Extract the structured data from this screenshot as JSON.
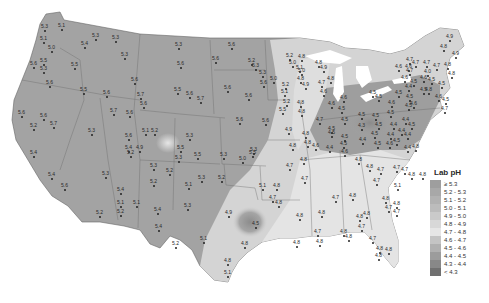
{
  "legend": {
    "title": "Lab pH",
    "items": [
      {
        "label": "≥ 5.3",
        "color": "#9e9e9e"
      },
      {
        "label": "5.2 - 5.3",
        "color": "#a8a8a8"
      },
      {
        "label": "5.1 - 5.2",
        "color": "#b2b2b2"
      },
      {
        "label": "5.0 - 5.1",
        "color": "#bcbcbc"
      },
      {
        "label": "4.9 - 5.0",
        "color": "#cacaca"
      },
      {
        "label": "4.8 - 4.9",
        "color": "#d8d8d8"
      },
      {
        "label": "4.7 - 4.8",
        "color": "#e6e6e6"
      },
      {
        "label": "4.6 - 4.7",
        "color": "#c4c4c4"
      },
      {
        "label": "4.5 - 4.6",
        "color": "#b0b0b0"
      },
      {
        "label": "4.4 - 4.5",
        "color": "#9c9c9c"
      },
      {
        "label": "4.3 - 4.4",
        "color": "#888888"
      },
      {
        "label": "< 4.3",
        "color": "#707070"
      }
    ]
  },
  "stations": [
    {
      "x": 58,
      "y": 23,
      "v": "5.1"
    },
    {
      "x": 41,
      "y": 24,
      "v": "5.3"
    },
    {
      "x": 40,
      "y": 36,
      "v": "5.1"
    },
    {
      "x": 48,
      "y": 45,
      "v": "5.0"
    },
    {
      "x": 30,
      "y": 61,
      "v": "5.6"
    },
    {
      "x": 40,
      "y": 58,
      "v": "5.5"
    },
    {
      "x": 40,
      "y": 66,
      "v": "5.3"
    },
    {
      "x": 46,
      "y": 80,
      "v": "5.6"
    },
    {
      "x": 71,
      "y": 62,
      "v": "5.5"
    },
    {
      "x": 81,
      "y": 41,
      "v": "5.4"
    },
    {
      "x": 92,
      "y": 33,
      "v": "5.3"
    },
    {
      "x": 112,
      "y": 35,
      "v": "5.3"
    },
    {
      "x": 121,
      "y": 52,
      "v": "5.3"
    },
    {
      "x": 80,
      "y": 87,
      "v": "5.5"
    },
    {
      "x": 103,
      "y": 90,
      "v": "5.6"
    },
    {
      "x": 131,
      "y": 77,
      "v": "5.6"
    },
    {
      "x": 137,
      "y": 92,
      "v": "5.7"
    },
    {
      "x": 140,
      "y": 101,
      "v": "5.6"
    },
    {
      "x": 110,
      "y": 108,
      "v": "5.7"
    },
    {
      "x": 126,
      "y": 110,
      "v": "5.6"
    },
    {
      "x": 18,
      "y": 110,
      "v": "5.6"
    },
    {
      "x": 40,
      "y": 113,
      "v": "5.6"
    },
    {
      "x": 30,
      "y": 123,
      "v": "5.2"
    },
    {
      "x": 50,
      "y": 121,
      "v": "5.7"
    },
    {
      "x": 88,
      "y": 128,
      "v": "5.3"
    },
    {
      "x": 125,
      "y": 133,
      "v": "5.6"
    },
    {
      "x": 125,
      "y": 145,
      "v": "5.4"
    },
    {
      "x": 142,
      "y": 128,
      "v": "5.1"
    },
    {
      "x": 151,
      "y": 128,
      "v": "5.2"
    },
    {
      "x": 127,
      "y": 150,
      "v": "5.2"
    },
    {
      "x": 136,
      "y": 145,
      "v": "4.9"
    },
    {
      "x": 30,
      "y": 150,
      "v": "5.4"
    },
    {
      "x": 48,
      "y": 172,
      "v": "5.4"
    },
    {
      "x": 61,
      "y": 183,
      "v": "5.6"
    },
    {
      "x": 102,
      "y": 171,
      "v": "5.3"
    },
    {
      "x": 117,
      "y": 187,
      "v": "5.4"
    },
    {
      "x": 117,
      "y": 200,
      "v": "5.1"
    },
    {
      "x": 133,
      "y": 200,
      "v": "5.1"
    },
    {
      "x": 117,
      "y": 209,
      "v": "5.2"
    },
    {
      "x": 96,
      "y": 210,
      "v": "5.2"
    },
    {
      "x": 150,
      "y": 179,
      "v": "5.2"
    },
    {
      "x": 154,
      "y": 207,
      "v": "5.4"
    },
    {
      "x": 155,
      "y": 224,
      "v": "5.4"
    },
    {
      "x": 172,
      "y": 241,
      "v": "5.2"
    },
    {
      "x": 175,
      "y": 155,
      "v": "5.3"
    },
    {
      "x": 166,
      "y": 168,
      "v": "5.2"
    },
    {
      "x": 150,
      "y": 163,
      "v": "5.3"
    },
    {
      "x": 177,
      "y": 145,
      "v": "5.5"
    },
    {
      "x": 194,
      "y": 152,
      "v": "5.5"
    },
    {
      "x": 185,
      "y": 182,
      "v": "5.1"
    },
    {
      "x": 184,
      "y": 203,
      "v": "5.3"
    },
    {
      "x": 198,
      "y": 175,
      "v": "5.3"
    },
    {
      "x": 200,
      "y": 236,
      "v": "5.1"
    },
    {
      "x": 218,
      "y": 175,
      "v": "5.2"
    },
    {
      "x": 225,
      "y": 210,
      "v": "4.9"
    },
    {
      "x": 250,
      "y": 147,
      "v": "5.3"
    },
    {
      "x": 249,
      "y": 150,
      "v": "5.5"
    },
    {
      "x": 239,
      "y": 156,
      "v": "5.0"
    },
    {
      "x": 252,
      "y": 221,
      "v": "4.5"
    },
    {
      "x": 241,
      "y": 241,
      "v": "4.8"
    },
    {
      "x": 224,
      "y": 258,
      "v": "4.8"
    },
    {
      "x": 224,
      "y": 270,
      "v": "5.1"
    },
    {
      "x": 259,
      "y": 183,
      "v": "5.1"
    },
    {
      "x": 273,
      "y": 183,
      "v": "4.8"
    },
    {
      "x": 269,
      "y": 195,
      "v": "4.7"
    },
    {
      "x": 275,
      "y": 200,
      "v": "4.8"
    },
    {
      "x": 296,
      "y": 213,
      "v": "4.8"
    },
    {
      "x": 293,
      "y": 240,
      "v": "4.8"
    },
    {
      "x": 286,
      "y": 163,
      "v": "4.7"
    },
    {
      "x": 301,
      "y": 176,
      "v": "4.7"
    },
    {
      "x": 300,
      "y": 157,
      "v": "4.8"
    },
    {
      "x": 175,
      "y": 42,
      "v": "5.3"
    },
    {
      "x": 177,
      "y": 61,
      "v": "5.6"
    },
    {
      "x": 212,
      "y": 56,
      "v": "5.6"
    },
    {
      "x": 228,
      "y": 42,
      "v": "5.6"
    },
    {
      "x": 174,
      "y": 87,
      "v": "5.5"
    },
    {
      "x": 186,
      "y": 91,
      "v": "5.6"
    },
    {
      "x": 197,
      "y": 96,
      "v": "5.7"
    },
    {
      "x": 224,
      "y": 85,
      "v": "5.6"
    },
    {
      "x": 245,
      "y": 93,
      "v": "5.6"
    },
    {
      "x": 236,
      "y": 117,
      "v": "5.6"
    },
    {
      "x": 186,
      "y": 133,
      "v": "5.3"
    },
    {
      "x": 220,
      "y": 152,
      "v": "5.3"
    },
    {
      "x": 248,
      "y": 58,
      "v": "5.2"
    },
    {
      "x": 252,
      "y": 63,
      "v": "5.3"
    },
    {
      "x": 259,
      "y": 70,
      "v": "5.3"
    },
    {
      "x": 260,
      "y": 80,
      "v": "5.6"
    },
    {
      "x": 270,
      "y": 76,
      "v": "5.0"
    },
    {
      "x": 282,
      "y": 82,
      "v": "5.2"
    },
    {
      "x": 281,
      "y": 89,
      "v": "5.1"
    },
    {
      "x": 283,
      "y": 99,
      "v": "5.2"
    },
    {
      "x": 279,
      "y": 107,
      "v": "5.5"
    },
    {
      "x": 262,
      "y": 118,
      "v": "5.6"
    },
    {
      "x": 285,
      "y": 127,
      "v": "4.9"
    },
    {
      "x": 289,
      "y": 143,
      "v": "4.8"
    },
    {
      "x": 286,
      "y": 53,
      "v": "5.2"
    },
    {
      "x": 289,
      "y": 60,
      "v": "5.0"
    },
    {
      "x": 298,
      "y": 54,
      "v": "4.8"
    },
    {
      "x": 296,
      "y": 65,
      "v": "5.1"
    },
    {
      "x": 298,
      "y": 68,
      "v": "5.0"
    },
    {
      "x": 297,
      "y": 76,
      "v": "4.8"
    },
    {
      "x": 302,
      "y": 82,
      "v": "4.9"
    },
    {
      "x": 297,
      "y": 100,
      "v": "4.8"
    },
    {
      "x": 298,
      "y": 109,
      "v": "4.8"
    },
    {
      "x": 302,
      "y": 131,
      "v": "4.8"
    },
    {
      "x": 304,
      "y": 140,
      "v": "4.8"
    },
    {
      "x": 315,
      "y": 60,
      "v": "4.8"
    },
    {
      "x": 320,
      "y": 65,
      "v": "4.9"
    },
    {
      "x": 318,
      "y": 80,
      "v": "4.7"
    },
    {
      "x": 320,
      "y": 89,
      "v": "4.6"
    },
    {
      "x": 327,
      "y": 76,
      "v": "4.8"
    },
    {
      "x": 328,
      "y": 101,
      "v": "4.6"
    },
    {
      "x": 338,
      "y": 106,
      "v": "4.5"
    },
    {
      "x": 340,
      "y": 95,
      "v": "4.6"
    },
    {
      "x": 316,
      "y": 117,
      "v": "4.7"
    },
    {
      "x": 328,
      "y": 126,
      "v": "4.5"
    },
    {
      "x": 328,
      "y": 130,
      "v": "4.5"
    },
    {
      "x": 341,
      "y": 117,
      "v": "4.5"
    },
    {
      "x": 341,
      "y": 134,
      "v": "4.5"
    },
    {
      "x": 312,
      "y": 143,
      "v": "4.6"
    },
    {
      "x": 326,
      "y": 145,
      "v": "4.4"
    },
    {
      "x": 340,
      "y": 141,
      "v": "4.5"
    },
    {
      "x": 341,
      "y": 149,
      "v": "4.6"
    },
    {
      "x": 358,
      "y": 112,
      "v": "4.5"
    },
    {
      "x": 358,
      "y": 123,
      "v": "4.3"
    },
    {
      "x": 372,
      "y": 113,
      "v": "4.5"
    },
    {
      "x": 375,
      "y": 122,
      "v": "4.5"
    },
    {
      "x": 359,
      "y": 137,
      "v": "4.4"
    },
    {
      "x": 371,
      "y": 131,
      "v": "4.5"
    },
    {
      "x": 374,
      "y": 141,
      "v": "4.5"
    },
    {
      "x": 387,
      "y": 110,
      "v": "4.5"
    },
    {
      "x": 390,
      "y": 122,
      "v": "4.4"
    },
    {
      "x": 387,
      "y": 132,
      "v": "4.4"
    },
    {
      "x": 386,
      "y": 141,
      "v": "4.6"
    },
    {
      "x": 393,
      "y": 138,
      "v": "4.5"
    },
    {
      "x": 402,
      "y": 117,
      "v": "4.4"
    },
    {
      "x": 408,
      "y": 122,
      "v": "4.5"
    },
    {
      "x": 398,
      "y": 128,
      "v": "4.4"
    },
    {
      "x": 404,
      "y": 132,
      "v": "4.4"
    },
    {
      "x": 412,
      "y": 144,
      "v": "4.8"
    },
    {
      "x": 404,
      "y": 145,
      "v": "4.4"
    },
    {
      "x": 375,
      "y": 94,
      "v": "4.5"
    },
    {
      "x": 369,
      "y": 90,
      "v": "4.5"
    },
    {
      "x": 388,
      "y": 100,
      "v": "4.6"
    },
    {
      "x": 395,
      "y": 90,
      "v": "4.5"
    },
    {
      "x": 406,
      "y": 94,
      "v": "4.5"
    },
    {
      "x": 405,
      "y": 103,
      "v": "4.5"
    },
    {
      "x": 410,
      "y": 101,
      "v": "4.6"
    },
    {
      "x": 405,
      "y": 84,
      "v": "4.4"
    },
    {
      "x": 401,
      "y": 75,
      "v": "4.6"
    },
    {
      "x": 395,
      "y": 64,
      "v": "4.6"
    },
    {
      "x": 406,
      "y": 68,
      "v": "4.7"
    },
    {
      "x": 410,
      "y": 79,
      "v": "4.5"
    },
    {
      "x": 420,
      "y": 75,
      "v": "4.6"
    },
    {
      "x": 412,
      "y": 60,
      "v": "4.7"
    },
    {
      "x": 406,
      "y": 57,
      "v": "4.7"
    },
    {
      "x": 405,
      "y": 64,
      "v": "4.6"
    },
    {
      "x": 424,
      "y": 69,
      "v": "4.0"
    },
    {
      "x": 428,
      "y": 77,
      "v": "4.5"
    },
    {
      "x": 438,
      "y": 81,
      "v": "4.5"
    },
    {
      "x": 420,
      "y": 87,
      "v": "4.5"
    },
    {
      "x": 435,
      "y": 94,
      "v": "4.6"
    },
    {
      "x": 442,
      "y": 97,
      "v": "4.5"
    },
    {
      "x": 441,
      "y": 106,
      "v": "4.7"
    },
    {
      "x": 446,
      "y": 34,
      "v": "4.9"
    },
    {
      "x": 440,
      "y": 44,
      "v": "4.8"
    },
    {
      "x": 452,
      "y": 51,
      "v": "4.9"
    },
    {
      "x": 444,
      "y": 62,
      "v": "4.8"
    },
    {
      "x": 448,
      "y": 71,
      "v": "4.8"
    },
    {
      "x": 423,
      "y": 60,
      "v": "4.7"
    },
    {
      "x": 425,
      "y": 87,
      "v": "4.8"
    },
    {
      "x": 433,
      "y": 63,
      "v": "4.7"
    },
    {
      "x": 355,
      "y": 157,
      "v": "4.8"
    },
    {
      "x": 366,
      "y": 164,
      "v": "4.8"
    },
    {
      "x": 377,
      "y": 167,
      "v": "4.7"
    },
    {
      "x": 393,
      "y": 165,
      "v": "4.7"
    },
    {
      "x": 401,
      "y": 167,
      "v": "4.7"
    },
    {
      "x": 408,
      "y": 172,
      "v": "4.8"
    },
    {
      "x": 419,
      "y": 172,
      "v": "4.8"
    },
    {
      "x": 394,
      "y": 183,
      "v": "5.1"
    },
    {
      "x": 373,
      "y": 178,
      "v": "4.7"
    },
    {
      "x": 349,
      "y": 193,
      "v": "4.8"
    },
    {
      "x": 382,
      "y": 196,
      "v": "4.8"
    },
    {
      "x": 385,
      "y": 205,
      "v": "4.7"
    },
    {
      "x": 393,
      "y": 209,
      "v": "4.7"
    },
    {
      "x": 393,
      "y": 201,
      "v": "4.8"
    },
    {
      "x": 332,
      "y": 195,
      "v": "4.7"
    },
    {
      "x": 318,
      "y": 210,
      "v": "4.8"
    },
    {
      "x": 356,
      "y": 214,
      "v": "4.8"
    },
    {
      "x": 363,
      "y": 211,
      "v": "4.8"
    },
    {
      "x": 358,
      "y": 224,
      "v": "4.7"
    },
    {
      "x": 314,
      "y": 229,
      "v": "4.7"
    },
    {
      "x": 316,
      "y": 239,
      "v": "4.8"
    },
    {
      "x": 340,
      "y": 229,
      "v": "4.8"
    },
    {
      "x": 345,
      "y": 234,
      "v": "4.8"
    },
    {
      "x": 369,
      "y": 236,
      "v": "4.7"
    },
    {
      "x": 376,
      "y": 246,
      "v": "4.8"
    },
    {
      "x": 375,
      "y": 253,
      "v": "4.8"
    },
    {
      "x": 385,
      "y": 247,
      "v": "4.8"
    }
  ]
}
